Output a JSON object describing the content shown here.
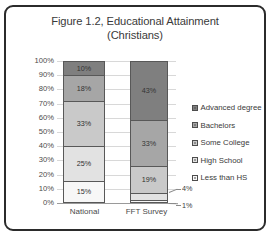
{
  "chart_data": {
    "type": "bar",
    "subtype": "stacked-100-percent",
    "title": "Figure 1.2, Educational Attainment (Christians)",
    "title_line1": "Figure 1.2, Educational Attainment",
    "title_line2": "(Christians)",
    "xlabel": "",
    "ylabel": "",
    "categories": [
      "National",
      "FFT Survey"
    ],
    "ylim": [
      0,
      100
    ],
    "ytick_labels": [
      "100%",
      "90%",
      "80%",
      "70%",
      "60%",
      "50%",
      "40%",
      "30%",
      "20%",
      "10%",
      "0%"
    ],
    "ytick_values": [
      100,
      90,
      80,
      70,
      60,
      50,
      40,
      30,
      20,
      10,
      0
    ],
    "grid": true,
    "legend_position": "right",
    "series": [
      {
        "name": "Advanced degree",
        "color": "#7f7f7f",
        "values": [
          10,
          43
        ],
        "labels": [
          "10%",
          "43%"
        ]
      },
      {
        "name": "Bachelors",
        "color": "#a6a6a6",
        "values": [
          18,
          33
        ],
        "labels": [
          "18%",
          "33%"
        ]
      },
      {
        "name": "Some College",
        "color": "#c9c9c9",
        "values": [
          33,
          19
        ],
        "labels": [
          "33%",
          "19%"
        ]
      },
      {
        "name": "High School",
        "color": "#e2e2e2",
        "values": [
          25,
          4
        ],
        "labels": [
          "25%",
          "4%"
        ]
      },
      {
        "name": "Less than HS",
        "color": "#f7f7f7",
        "values": [
          15,
          1
        ],
        "labels": [
          "15%",
          "1%"
        ]
      }
    ],
    "annotations": [
      {
        "text": "4%",
        "refers_to": "FFT Survey / High School"
      },
      {
        "text": "1%",
        "refers_to": "FFT Survey / Less than HS"
      }
    ]
  },
  "bars": {
    "national": {
      "label": "National",
      "segments": [
        {
          "label": "10%",
          "pct": 10,
          "color": "#7f7f7f"
        },
        {
          "label": "18%",
          "pct": 18,
          "color": "#a6a6a6"
        },
        {
          "label": "33%",
          "pct": 33,
          "color": "#c9c9c9"
        },
        {
          "label": "25%",
          "pct": 25,
          "color": "#e2e2e2"
        },
        {
          "label": "15%",
          "pct": 15,
          "color": "#f7f7f7"
        }
      ]
    },
    "fft": {
      "label": "FFT Survey",
      "segments": [
        {
          "label": "43%",
          "pct": 43,
          "color": "#7f7f7f"
        },
        {
          "label": "33%",
          "pct": 33,
          "color": "#a6a6a6"
        },
        {
          "label": "19%",
          "pct": 19,
          "color": "#c9c9c9"
        },
        {
          "label": "",
          "pct": 4,
          "color": "#e2e2e2"
        },
        {
          "label": "",
          "pct": 1,
          "color": "#f7f7f7"
        }
      ]
    }
  },
  "callouts": {
    "high_school": "4%",
    "less_than_hs": "1%"
  },
  "legend": {
    "items": [
      {
        "label": "Advanced degree",
        "color": "#7f7f7f"
      },
      {
        "label": "Bachelors",
        "color": "#a6a6a6"
      },
      {
        "label": "Some College",
        "color": "#c9c9c9"
      },
      {
        "label": "High School",
        "color": "#e2e2e2"
      },
      {
        "label": "Less than HS",
        "color": "#f7f7f7"
      }
    ]
  }
}
